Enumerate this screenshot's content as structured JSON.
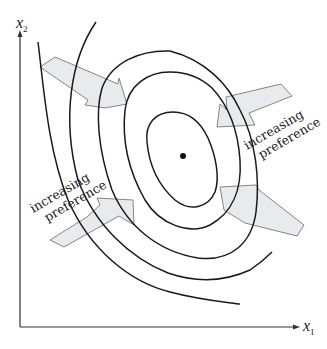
{
  "figure": {
    "type": "indifference-curves-bliss-point",
    "axes": {
      "x_label": "x",
      "x_subscript": "1",
      "y_label": "x",
      "y_subscript": "2"
    },
    "annotations": [
      {
        "id": "right",
        "line1": "increasing",
        "line2": "preference"
      },
      {
        "id": "left",
        "line1": "increasing",
        "line2": "preference"
      }
    ],
    "bliss_point": {
      "x": 183,
      "y": 156
    },
    "arrow_count": 4,
    "contour_count": 5,
    "colors": {
      "arrow_fill": "#e8ebee",
      "arrow_stroke": "#777777",
      "curve": "#1a1a1a",
      "text": "#222222"
    }
  }
}
